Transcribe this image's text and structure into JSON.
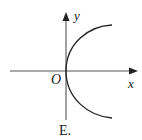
{
  "figure": {
    "option_label": "E.",
    "axes": {
      "x_label": "x",
      "y_label": "y",
      "origin_label": "O"
    },
    "curve": {
      "description": "right-opening curve with vertex at origin",
      "vertex": [
        0,
        0
      ],
      "opens": "right"
    },
    "colors": {
      "axis": "#333333",
      "curve": "#222222",
      "background": "#ffffff"
    }
  }
}
